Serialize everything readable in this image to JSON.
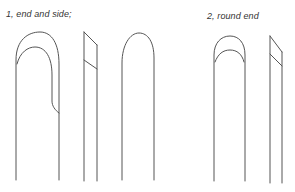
{
  "figure": {
    "groups": [
      {
        "caption": "1, end and side;",
        "views": [
          "front view (end and side bevel)",
          "side profile",
          "back view"
        ]
      },
      {
        "caption": "2, round end",
        "views": [
          "front view (round end)",
          "side profile"
        ]
      }
    ],
    "colors": {
      "line": "#555555",
      "text": "#333333",
      "background": "#ffffff"
    }
  }
}
